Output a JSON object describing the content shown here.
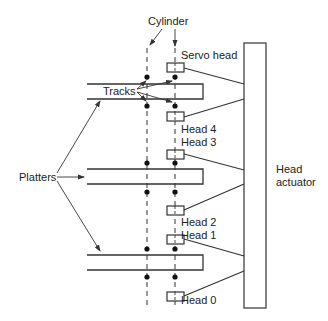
{
  "diagram": {
    "labels": {
      "cylinder": "Cylinder",
      "servo_head": "Servo head",
      "tracks": "Tracks",
      "platters": "Platters",
      "head_4": "Head 4",
      "head_3": "Head 3",
      "head_2": "Head 2",
      "head_1": "Head 1",
      "head_0": "Head 0",
      "actuator_line1": "Head",
      "actuator_line2": "actuator"
    },
    "components": {
      "platter_count": 3,
      "heads": [
        "Servo head",
        "Head 4",
        "Head 3",
        "Head 2",
        "Head 1",
        "Head 0"
      ],
      "actuator": "Head actuator"
    },
    "colors": {
      "line": "#333333",
      "text": "#222222",
      "background": "#ffffff"
    }
  }
}
